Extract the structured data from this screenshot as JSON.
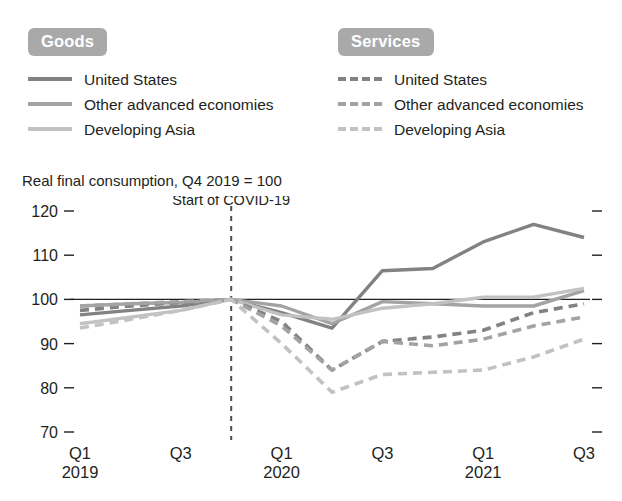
{
  "legends": [
    {
      "key": "goods",
      "badge": "Goods",
      "style": "solid",
      "items": [
        {
          "label": "United States",
          "color": "#828282",
          "dash": false
        },
        {
          "label": "Other advanced economies",
          "color": "#a3a3a3",
          "dash": false
        },
        {
          "label": "Developing Asia",
          "color": "#c2c2c2",
          "dash": false
        }
      ]
    },
    {
      "key": "services",
      "badge": "Services",
      "style": "dashed",
      "items": [
        {
          "label": "United States",
          "color": "#828282",
          "dash": true
        },
        {
          "label": "Other advanced economies",
          "color": "#a3a3a3",
          "dash": true
        },
        {
          "label": "Developing Asia",
          "color": "#c2c2c2",
          "dash": true
        }
      ]
    }
  ],
  "chart_data": {
    "type": "line",
    "title": "",
    "subtitle": "Real final consumption, Q4 2019 = 100",
    "xlabel": "",
    "ylabel": "",
    "ylim": [
      70,
      120
    ],
    "yticks": [
      70,
      80,
      90,
      100,
      110,
      120
    ],
    "grid": false,
    "legend_position": "top",
    "baseline_value": 100,
    "annotations": [
      {
        "text": "Start of COVID-19",
        "x": "Q4 2019",
        "type": "vertical-marker"
      }
    ],
    "x": [
      "Q1 2019",
      "Q2 2019",
      "Q3 2019",
      "Q4 2019",
      "Q1 2020",
      "Q2 2020",
      "Q3 2020",
      "Q4 2020",
      "Q1 2021",
      "Q2 2021",
      "Q3 2021"
    ],
    "xtick_labels": [
      {
        "quarter": "Q1",
        "year": "2019"
      },
      {
        "quarter": "Q3",
        "year": ""
      },
      {
        "quarter": "Q1",
        "year": "2020"
      },
      {
        "quarter": "Q3",
        "year": ""
      },
      {
        "quarter": "Q1",
        "year": "2021"
      },
      {
        "quarter": "Q3",
        "year": ""
      }
    ],
    "xtick_indices": [
      0,
      2,
      4,
      6,
      8,
      10
    ],
    "series": [
      {
        "name": "United States",
        "group": "Goods",
        "dash": false,
        "color": "#828282",
        "values": [
          96.5,
          97.5,
          98.5,
          100.0,
          97.0,
          93.5,
          106.5,
          107.0,
          113.0,
          117.0,
          114.0
        ]
      },
      {
        "name": "Other advanced economies",
        "group": "Goods",
        "dash": false,
        "color": "#a3a3a3",
        "values": [
          98.5,
          99.0,
          99.3,
          100.0,
          98.5,
          94.5,
          99.5,
          99.0,
          98.5,
          98.5,
          102.0
        ]
      },
      {
        "name": "Developing Asia",
        "group": "Goods",
        "dash": false,
        "color": "#c2c2c2",
        "values": [
          94.5,
          96.0,
          97.5,
          100.0,
          96.5,
          95.5,
          98.0,
          99.0,
          100.5,
          100.5,
          102.5
        ]
      },
      {
        "name": "United States",
        "group": "Services",
        "dash": true,
        "color": "#828282",
        "values": [
          97.5,
          98.5,
          99.3,
          100.0,
          95.0,
          84.0,
          90.5,
          91.5,
          93.0,
          97.0,
          99.0
        ]
      },
      {
        "name": "Other advanced economies",
        "group": "Services",
        "dash": true,
        "color": "#a3a3a3",
        "values": [
          98.5,
          99.0,
          99.5,
          100.0,
          94.0,
          84.0,
          90.5,
          89.5,
          91.0,
          94.0,
          96.0
        ]
      },
      {
        "name": "Developing Asia",
        "group": "Services",
        "dash": true,
        "color": "#c2c2c2",
        "values": [
          93.5,
          95.5,
          97.5,
          100.0,
          90.0,
          79.0,
          83.0,
          83.5,
          84.0,
          87.0,
          91.0
        ]
      }
    ]
  }
}
